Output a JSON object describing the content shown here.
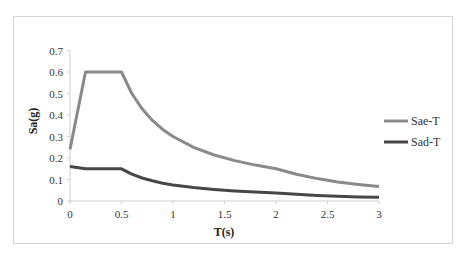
{
  "chart_data": {
    "type": "line",
    "title": "",
    "xlabel": "T(s)",
    "ylabel": "Sa(g)",
    "xlim": [
      0,
      3
    ],
    "ylim": [
      0,
      0.7
    ],
    "x_ticks": [
      "0",
      "0.5",
      "1",
      "1.5",
      "2",
      "2.5",
      "3"
    ],
    "y_ticks": [
      "0",
      "0.1",
      "0.2",
      "0.3",
      "0.4",
      "0.5",
      "0.6",
      "0.7"
    ],
    "grid": false,
    "legend_position": "right",
    "series": [
      {
        "name": "Sae-T",
        "color": "#8a8a8a",
        "x": [
          0,
          0.15,
          0.5,
          0.6,
          0.7,
          0.8,
          0.9,
          1.0,
          1.2,
          1.4,
          1.6,
          1.8,
          2.0,
          2.2,
          2.4,
          2.6,
          2.8,
          3.0
        ],
        "values": [
          0.24,
          0.6,
          0.6,
          0.5,
          0.429,
          0.375,
          0.333,
          0.3,
          0.25,
          0.214,
          0.188,
          0.167,
          0.15,
          0.124,
          0.104,
          0.089,
          0.077,
          0.067
        ]
      },
      {
        "name": "Sad-T",
        "color": "#474747",
        "x": [
          0,
          0.15,
          0.5,
          0.6,
          0.7,
          0.8,
          0.9,
          1.0,
          1.2,
          1.4,
          1.6,
          1.8,
          2.0,
          2.2,
          2.4,
          2.6,
          2.8,
          3.0
        ],
        "values": [
          0.16,
          0.15,
          0.15,
          0.125,
          0.107,
          0.094,
          0.083,
          0.075,
          0.063,
          0.054,
          0.047,
          0.042,
          0.0375,
          0.031,
          0.026,
          0.022,
          0.019,
          0.017
        ]
      }
    ]
  },
  "legend": {
    "items": [
      {
        "label": "Sae-T",
        "color": "#8a8a8a"
      },
      {
        "label": "Sad-T",
        "color": "#474747"
      }
    ]
  },
  "axes": {
    "x_title": "T(s)",
    "y_title": "Sa(g)"
  }
}
